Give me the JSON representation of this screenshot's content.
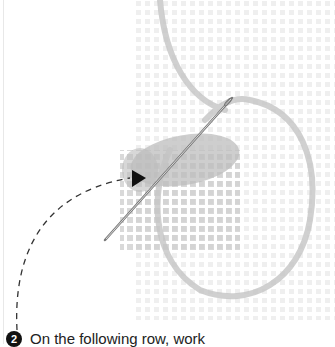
{
  "illustration": {
    "subject": "needle stitching yarn through canvas grid",
    "icons": [
      "needle-icon",
      "arrow-icon",
      "dashed-path"
    ],
    "colors": {
      "grid": "#d9d9d9",
      "yarn": "#b8b8b8",
      "needle": "#8a8a8a",
      "arrow": "#111111",
      "dash": "#333333"
    }
  },
  "step": {
    "number": "2",
    "text": "On the following row, work"
  }
}
